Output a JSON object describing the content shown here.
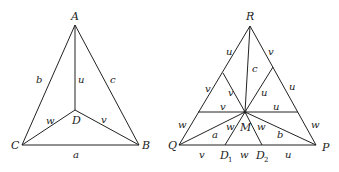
{
  "figure_left": {
    "vertices": {
      "A": "A",
      "B": "B",
      "C": "C",
      "D": "D"
    },
    "edge_labels": {
      "CA": "b",
      "AB": "c",
      "CB": "a",
      "AD": "u",
      "CD": "w",
      "DB": "v"
    }
  },
  "figure_right": {
    "vertices": {
      "R": "R",
      "Q": "Q",
      "P": "P",
      "M": "M",
      "D1": "D",
      "D1_sub": "1",
      "D2": "D",
      "D2_sub": "2"
    },
    "labels": {
      "RQ_upper": "u",
      "RQ_mid": "v",
      "RQ_lower": "w",
      "RP_upper": "v",
      "RP_mid": "u",
      "RP_lower": "w",
      "RM": "c",
      "left_inner_v": "v",
      "left_horiz_v": "v",
      "right_inner_u": "u",
      "right_horiz_u": "u",
      "QM": "a",
      "MP": "b",
      "MD1": "w",
      "MD2": "w",
      "QD1": "v",
      "D1D2": "w",
      "D2P": "u"
    }
  }
}
